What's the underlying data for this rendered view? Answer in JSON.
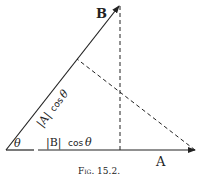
{
  "figure": {
    "caption": "Fig. 15.2.",
    "vector_a_label": "A",
    "vector_b_label": "B",
    "angle_label": "θ",
    "proj_b_on_a": {
      "abs": "|B|",
      "cos": "cos",
      "theta": "θ"
    },
    "proj_a_on_b": {
      "abs": "|A|",
      "cos": "cos",
      "theta": "θ"
    },
    "colors": {
      "stroke": "#222222",
      "background": "#ffffff"
    }
  }
}
